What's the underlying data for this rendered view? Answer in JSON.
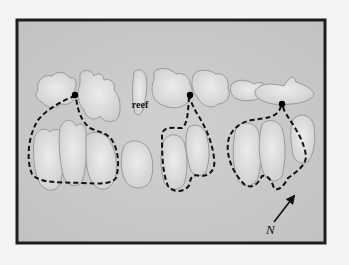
{
  "figure": {
    "labels": {
      "reef": "reef",
      "north": "N"
    },
    "colors": {
      "page": "#f4f4f4",
      "water": "#c9c9c9",
      "reef_fill": "#d8d8d8",
      "reef_outline": "#9a9a9a",
      "frame": "#1e1e1e",
      "territory": "#111111",
      "marker": "#000000"
    },
    "territories": [
      {
        "name": "territory-1",
        "has_marker": true
      },
      {
        "name": "territory-2",
        "has_marker": true
      },
      {
        "name": "territory-3",
        "has_marker": true
      }
    ],
    "compass": {
      "direction": "north-east",
      "label": "N"
    }
  }
}
